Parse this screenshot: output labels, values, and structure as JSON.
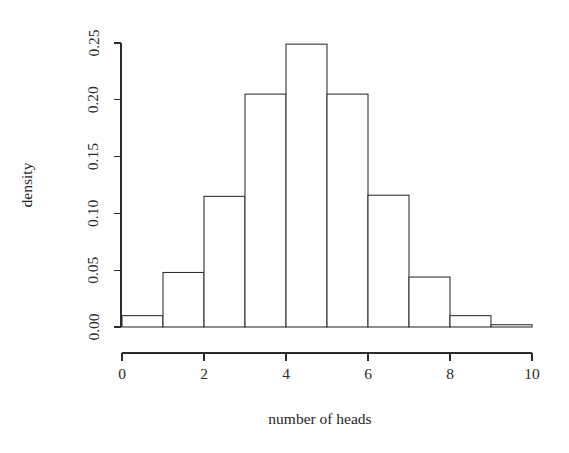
{
  "chart_data": {
    "type": "bar",
    "title": "",
    "subtitle": "",
    "xlabel": "number of heads",
    "ylabel": "density",
    "xlim": [
      0,
      10
    ],
    "ylim": [
      0.0,
      0.25
    ],
    "grid": false,
    "legend": null,
    "bin_width": 1,
    "bin_edges": [
      0,
      1,
      2,
      3,
      4,
      5,
      6,
      7,
      8,
      9,
      10
    ],
    "categories": [
      "0-1",
      "1-2",
      "2-3",
      "3-4",
      "4-5",
      "5-6",
      "6-7",
      "7-8",
      "8-9",
      "9-10"
    ],
    "values": [
      0.01,
      0.048,
      0.115,
      0.205,
      0.249,
      0.205,
      0.116,
      0.044,
      0.01,
      0.002
    ],
    "x_ticks": [
      0,
      2,
      4,
      6,
      8,
      10
    ],
    "x_tick_labels": [
      "0",
      "2",
      "4",
      "6",
      "8",
      "10"
    ],
    "y_ticks": [
      0.0,
      0.05,
      0.1,
      0.15,
      0.2,
      0.25
    ],
    "y_tick_labels": [
      "0.00",
      "0.05",
      "0.10",
      "0.15",
      "0.20",
      "0.25"
    ],
    "style": "r-base-histogram",
    "bar_fill_color": "#ffffff",
    "bar_stroke_color": "#2b2b2b",
    "axis_color": "#2b2b2b"
  },
  "axes": {
    "x_axis_label": "number of heads",
    "y_axis_label": "density"
  }
}
